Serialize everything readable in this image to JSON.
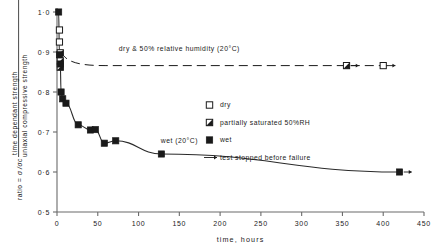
{
  "chart_data": {
    "type": "scatter",
    "title": "",
    "xlabel": "time, hours",
    "ylabel_prefix": "ratio =",
    "ylabel_symbol_num": "σ",
    "ylabel_symbol_den": "σc",
    "ylabel_numerator": "time dependant strength",
    "ylabel_denominator": "uniaxial compressive strength",
    "xlim": [
      0,
      450
    ],
    "ylim": [
      0.5,
      1.0
    ],
    "xticks": [
      0,
      50,
      100,
      150,
      200,
      250,
      300,
      350,
      400,
      450
    ],
    "xtick_labels": [
      "0",
      "50",
      "100",
      "150",
      "200",
      "250",
      "300",
      "350",
      "400",
      "450"
    ],
    "yticks": [
      0.5,
      0.6,
      0.7,
      0.8,
      0.9,
      1.0
    ],
    "ytick_labels": [
      "0·5",
      "0·6",
      "0·7",
      "0·8",
      "0·9",
      "1·0"
    ],
    "grid": false,
    "legend_position": "right-middle",
    "series": [
      {
        "name": "dry",
        "marker": "open-square",
        "points": [
          {
            "x": 3,
            "y": 0.955
          },
          {
            "x": 3,
            "y": 0.925
          },
          {
            "x": 400,
            "y": 0.866,
            "arrow": true
          }
        ]
      },
      {
        "name": "partially saturated 50%RH",
        "marker": "half-square",
        "points": [
          {
            "x": 4,
            "y": 0.898
          },
          {
            "x": 4,
            "y": 0.878
          },
          {
            "x": 4,
            "y": 0.862
          },
          {
            "x": 355,
            "y": 0.866,
            "arrow": true
          }
        ]
      },
      {
        "name": "wet",
        "marker": "filled-square",
        "points": [
          {
            "x": 2,
            "y": 1.0
          },
          {
            "x": 3,
            "y": 0.893
          },
          {
            "x": 4,
            "y": 0.87
          },
          {
            "x": 5,
            "y": 0.8
          },
          {
            "x": 7,
            "y": 0.783
          },
          {
            "x": 11,
            "y": 0.772
          },
          {
            "x": 26,
            "y": 0.718
          },
          {
            "x": 41,
            "y": 0.705
          },
          {
            "x": 47,
            "y": 0.706
          },
          {
            "x": 58,
            "y": 0.672
          },
          {
            "x": 72,
            "y": 0.678
          },
          {
            "x": 128,
            "y": 0.645
          },
          {
            "x": 420,
            "y": 0.6,
            "arrow": true
          }
        ],
        "curve": true
      }
    ],
    "annotations": [
      {
        "id": "dry-curve-label",
        "text": "dry & 50% relative humidity (20°C)",
        "x": 150,
        "y": 0.893,
        "style": "dashed-line"
      },
      {
        "id": "wet-curve-label",
        "text": "wet (20°C)",
        "x": 150,
        "y": 0.662,
        "style": "plain"
      }
    ],
    "legend_entries": [
      {
        "marker": "open-square",
        "label": "dry"
      },
      {
        "marker": "half-square",
        "label": "partially saturated 50%RH"
      },
      {
        "marker": "filled-square",
        "label": "wet"
      },
      {
        "marker": "arrow",
        "label": "test stopped before failure"
      }
    ]
  },
  "colors": {
    "ink": "#1a1a1a",
    "axis": "#6b6b6b",
    "curve": "#2a2a2a",
    "background": "#ffffff"
  }
}
